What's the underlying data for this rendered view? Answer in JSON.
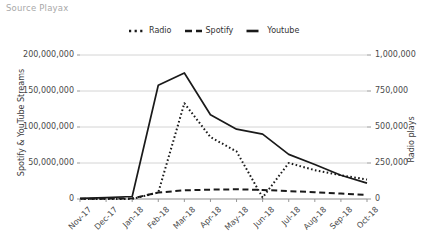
{
  "source_note": "Source Playax",
  "legend": {
    "items": [
      {
        "label": "Radio",
        "style": "dotted",
        "color": "#1a1a1a"
      },
      {
        "label": "Spotify",
        "style": "dashed",
        "color": "#1a1a1a"
      },
      {
        "label": "Youtube",
        "style": "solid",
        "color": "#1a1a1a"
      }
    ]
  },
  "axes": {
    "left_title": "Spotify & YouTube Streams",
    "right_title": "Radio plays",
    "left_ticks": [
      "0",
      "50,000,000",
      "100,000,000",
      "150,000,000",
      "200,000,000"
    ],
    "right_ticks": [
      "0",
      "250,000",
      "500,000",
      "750,000",
      "1,000,000"
    ]
  },
  "chart_data": {
    "type": "line",
    "title": "",
    "subtitle": "",
    "xlabel": "",
    "ylabel": "Spotify & YouTube Streams",
    "y2label": "Radio plays",
    "grid": true,
    "legend_position": "top",
    "categories": [
      "Nov-17",
      "Dec-17",
      "Jan-18",
      "Feb-18",
      "Mar-18",
      "Apr-18",
      "May-18",
      "Jun-18",
      "Jul-18",
      "Aug-18",
      "Sep-18",
      "Oct-18"
    ],
    "ylim": [
      0,
      200000000
    ],
    "y2lim": [
      0,
      1000000
    ],
    "yticks": [
      0,
      50000000,
      100000000,
      150000000,
      200000000
    ],
    "y2ticks": [
      0,
      250000,
      500000,
      750000,
      1000000
    ],
    "series": [
      {
        "name": "Youtube",
        "axis": "left",
        "style": "solid",
        "color": "#1a1a1a",
        "values": [
          1000000,
          2000000,
          3500000,
          158000000,
          175000000,
          117000000,
          97000000,
          90000000,
          62000000,
          48000000,
          33000000,
          22000000
        ]
      },
      {
        "name": "Spotify",
        "axis": "left",
        "style": "dashed",
        "color": "#1a1a1a",
        "values": [
          300000,
          500000,
          900000,
          9000000,
          12000000,
          13000000,
          13500000,
          12500000,
          11000000,
          9500000,
          7500000,
          5500000
        ]
      },
      {
        "name": "Radio",
        "axis": "right",
        "style": "dotted",
        "color": "#1a1a1a",
        "values": [
          0,
          0,
          0,
          45000,
          665000,
          430000,
          330000,
          10000,
          250000,
          200000,
          165000,
          135000
        ]
      }
    ]
  },
  "geometry": {
    "plot_left": 80,
    "plot_right": 367,
    "plot_top": 55,
    "plot_bottom": 199
  }
}
